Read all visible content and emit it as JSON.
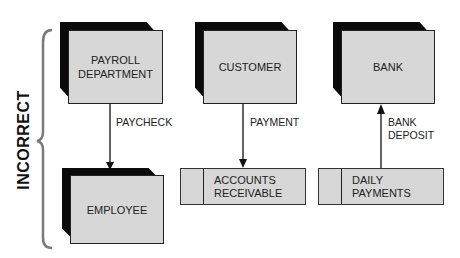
{
  "diagram": {
    "side_label": "INCORRECT",
    "entities": [
      {
        "id": "payroll",
        "label": "PAYROLL DEPARTMENT"
      },
      {
        "id": "customer",
        "label": "CUSTOMER"
      },
      {
        "id": "bank",
        "label": "BANK"
      },
      {
        "id": "employee",
        "label": "EMPLOYEE"
      }
    ],
    "data_stores": [
      {
        "id": "accounts_receivable",
        "label_line1": "ACCOUNTS",
        "label_line2": "RECEIVABLE"
      },
      {
        "id": "daily_payments",
        "label_line1": "DAILY",
        "label_line2": "PAYMENTS"
      }
    ],
    "flows": [
      {
        "from": "payroll",
        "to": "employee",
        "label": "PAYCHECK"
      },
      {
        "from": "customer",
        "to": "accounts_receivable",
        "label": "PAYMENT"
      },
      {
        "from": "daily_payments",
        "to": "bank",
        "label_line1": "BANK",
        "label_line2": "DEPOSIT"
      }
    ],
    "colors": {
      "box_fill": "#d7d7d7",
      "shadow": "#0a0a0a",
      "bracket": "#777777",
      "line": "#111111"
    }
  }
}
